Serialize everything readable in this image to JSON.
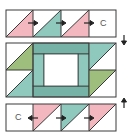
{
  "diagram": {
    "type": "quilt-block-assembly",
    "colors": {
      "pink": "#f3b8bf",
      "teal": "#8fc8bd",
      "teal_dark": "#76b3a6",
      "green": "#9dbe7c",
      "white": "#ffffff",
      "outline": "#3a3a3a"
    },
    "top_row": {
      "units": [
        "pink-hst",
        "teal-hst",
        "pink-hst",
        "plain-square"
      ],
      "plain_label": "C",
      "press_arrows": [
        "right",
        "right",
        "right"
      ],
      "side_arrow": "down"
    },
    "center_block": {
      "left_column": [
        "green-hst",
        "teal-hst"
      ],
      "center": "framed-square",
      "right_column": [
        "teal-hst",
        "green-hst"
      ]
    },
    "bottom_row": {
      "units": [
        "plain-square",
        "pink-hst",
        "teal-hst",
        "pink-hst"
      ],
      "plain_label": "C",
      "press_arrows": [
        "left",
        "right",
        "right"
      ],
      "side_arrow": "up"
    }
  }
}
